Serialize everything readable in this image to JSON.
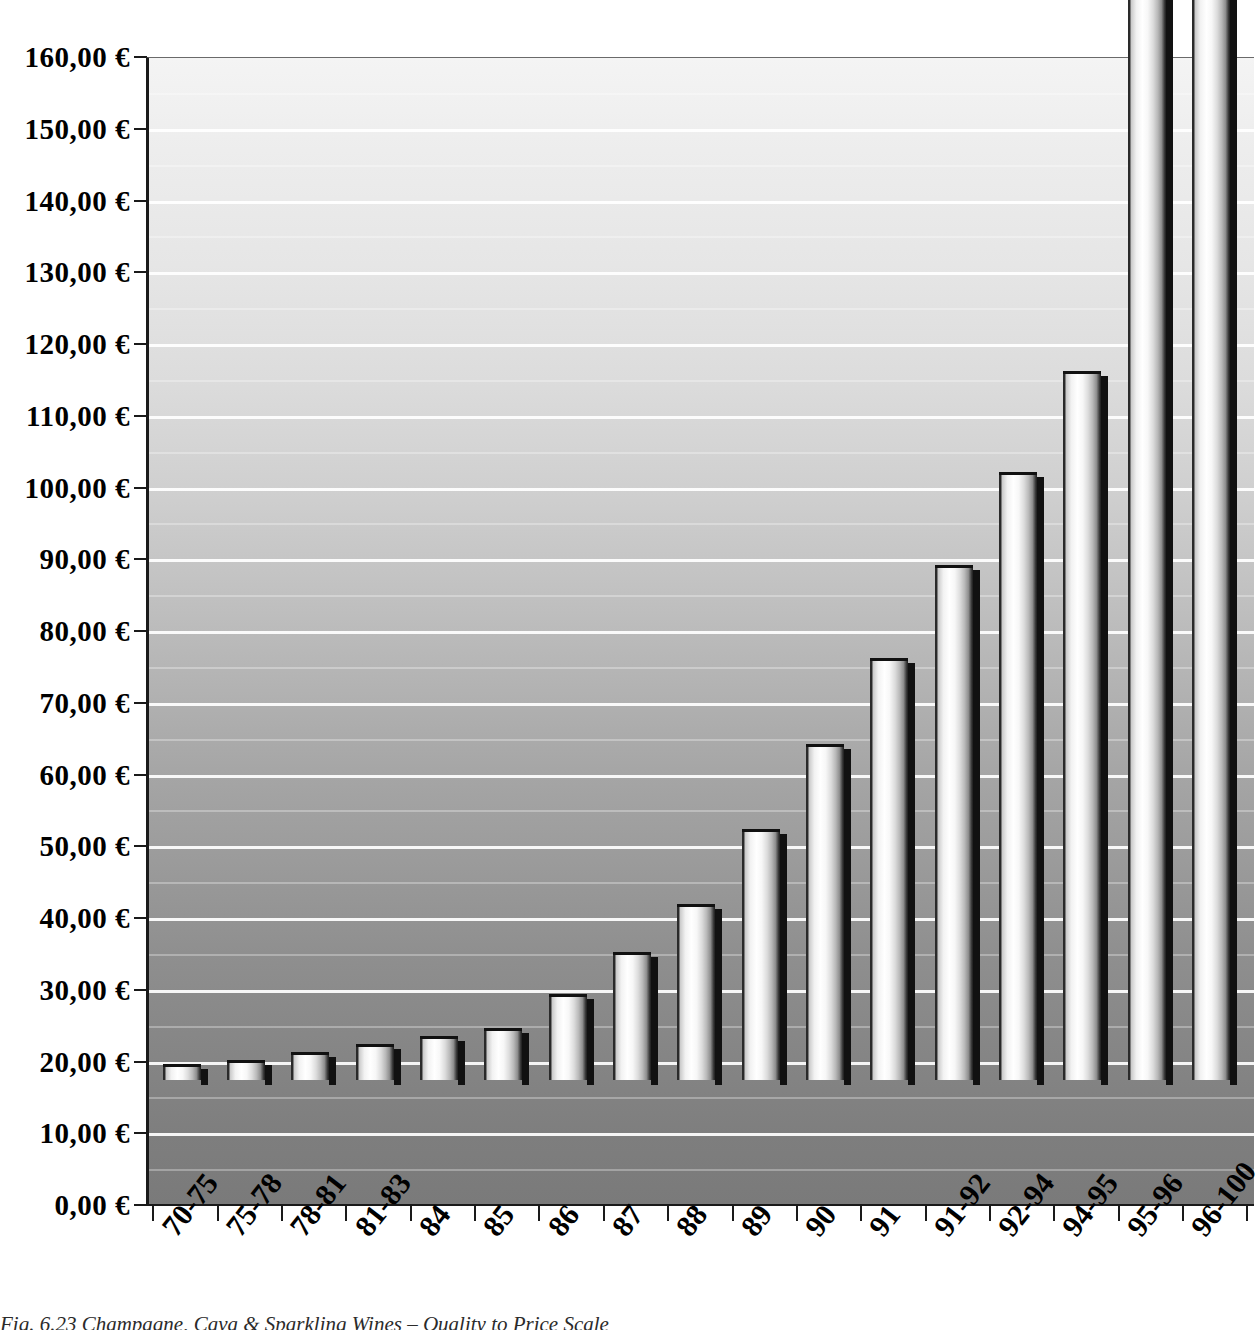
{
  "chart_data": {
    "type": "bar",
    "title": "",
    "xlabel": "",
    "ylabel": "",
    "ylim": [
      0,
      160
    ],
    "ytick_step": 10,
    "grid": true,
    "legend": false,
    "currency_symbol": "€",
    "decimal_separator": ",",
    "categories": [
      "70-75",
      "75-78",
      "78-81",
      "81-83",
      "84",
      "85",
      "86",
      "87",
      "88",
      "89",
      "90",
      "91",
      "91-92",
      "92-94",
      "94-95",
      "95-96",
      "96-100"
    ],
    "values": [
      2.3,
      2.8,
      3.9,
      5.0,
      6.1,
      7.2,
      12.0,
      17.9,
      24.6,
      35.0,
      46.8,
      58.8,
      71.8,
      84.7,
      98.8,
      178.0,
      180.0
    ],
    "clipped_above_axis": [
      "95-96",
      "96-100"
    ],
    "ytick_labels": [
      "160,00 €",
      "150,00 €",
      "140,00 €",
      "130,00 €",
      "120,00 €",
      "110,00 €",
      "100,00 €",
      "90,00 €",
      "80,00 €",
      "70,00 €",
      "60,00 €",
      "50,00 €",
      "40,00 €",
      "30,00 €",
      "20,00 €",
      "10,00 €",
      "0,00 €"
    ],
    "ytick_values": [
      160,
      150,
      140,
      130,
      120,
      110,
      100,
      90,
      80,
      70,
      60,
      50,
      40,
      30,
      20,
      10,
      0
    ]
  },
  "caption": {
    "text": "Fig. 6.23  Champagne, Cava & Sparkling Wines – Quality to Price Scale"
  },
  "colors": {
    "axis": "#1a1a1a",
    "gridline": "#ffffff",
    "bar_highlight": "#ffffff",
    "bar_shadow": "#111111",
    "plot_bg_top": "#f4f4f4",
    "plot_bg_bottom": "#7a7a7a"
  }
}
